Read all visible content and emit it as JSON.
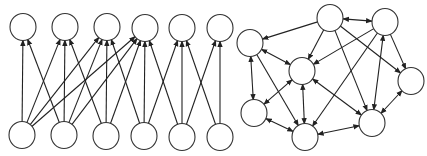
{
  "diagram": {
    "colors": {
      "background": "#ffffff",
      "node_stroke": "#333333",
      "edge": "#222222"
    },
    "node_radius": 13,
    "left_graph": {
      "name": "layered-feedforward-network",
      "nodes": [
        {
          "id": "t1",
          "x": 23,
          "y": 27
        },
        {
          "id": "t2",
          "x": 65,
          "y": 27
        },
        {
          "id": "t3",
          "x": 107,
          "y": 27
        },
        {
          "id": "t4",
          "x": 145,
          "y": 28
        },
        {
          "id": "t5",
          "x": 182,
          "y": 28
        },
        {
          "id": "t6",
          "x": 220,
          "y": 28
        },
        {
          "id": "b1",
          "x": 22,
          "y": 135
        },
        {
          "id": "b2",
          "x": 64,
          "y": 135
        },
        {
          "id": "b3",
          "x": 106,
          "y": 136
        },
        {
          "id": "b4",
          "x": 144,
          "y": 136
        },
        {
          "id": "b5",
          "x": 182,
          "y": 137
        },
        {
          "id": "b6",
          "x": 220,
          "y": 137
        }
      ],
      "edges": [
        {
          "from": "b1",
          "to": "t1"
        },
        {
          "from": "b1",
          "to": "t2"
        },
        {
          "from": "b1",
          "to": "t3"
        },
        {
          "from": "b1",
          "to": "t4"
        },
        {
          "from": "b2",
          "to": "t1"
        },
        {
          "from": "b2",
          "to": "t2"
        },
        {
          "from": "b2",
          "to": "t3"
        },
        {
          "from": "b2",
          "to": "t4"
        },
        {
          "from": "b3",
          "to": "t2"
        },
        {
          "from": "b3",
          "to": "t3"
        },
        {
          "from": "b3",
          "to": "t4"
        },
        {
          "from": "b4",
          "to": "t3"
        },
        {
          "from": "b4",
          "to": "t4"
        },
        {
          "from": "b4",
          "to": "t5"
        },
        {
          "from": "b5",
          "to": "t4"
        },
        {
          "from": "b5",
          "to": "t5"
        },
        {
          "from": "b5",
          "to": "t6"
        },
        {
          "from": "b6",
          "to": "t5"
        },
        {
          "from": "b6",
          "to": "t6"
        }
      ]
    },
    "right_graph": {
      "name": "recurrent-network",
      "nodes": [
        {
          "id": "n1",
          "x": 250,
          "y": 43
        },
        {
          "id": "n2",
          "x": 330,
          "y": 18
        },
        {
          "id": "n3",
          "x": 385,
          "y": 22
        },
        {
          "id": "n4",
          "x": 302,
          "y": 71
        },
        {
          "id": "n5",
          "x": 411,
          "y": 81
        },
        {
          "id": "n6",
          "x": 254,
          "y": 113
        },
        {
          "id": "n7",
          "x": 305,
          "y": 137
        },
        {
          "id": "n8",
          "x": 372,
          "y": 123
        }
      ],
      "edges": [
        {
          "from": "n2",
          "to": "n1",
          "both": false
        },
        {
          "from": "n2",
          "to": "n3",
          "both": true
        },
        {
          "from": "n1",
          "to": "n4",
          "both": true
        },
        {
          "from": "n1",
          "to": "n6",
          "both": true
        },
        {
          "from": "n1",
          "to": "n7",
          "both": false
        },
        {
          "from": "n2",
          "to": "n4",
          "both": false
        },
        {
          "from": "n2",
          "to": "n8",
          "both": false
        },
        {
          "from": "n2",
          "to": "n5",
          "both": false
        },
        {
          "from": "n3",
          "to": "n4",
          "both": false
        },
        {
          "from": "n3",
          "to": "n7",
          "both": false
        },
        {
          "from": "n3",
          "to": "n8",
          "both": true
        },
        {
          "from": "n3",
          "to": "n5",
          "both": false
        },
        {
          "from": "n4",
          "to": "n6",
          "both": true
        },
        {
          "from": "n4",
          "to": "n7",
          "both": true
        },
        {
          "from": "n4",
          "to": "n8",
          "both": true
        },
        {
          "from": "n6",
          "to": "n7",
          "both": true
        },
        {
          "from": "n7",
          "to": "n8",
          "both": true
        },
        {
          "from": "n5",
          "to": "n8",
          "both": true
        }
      ]
    }
  }
}
